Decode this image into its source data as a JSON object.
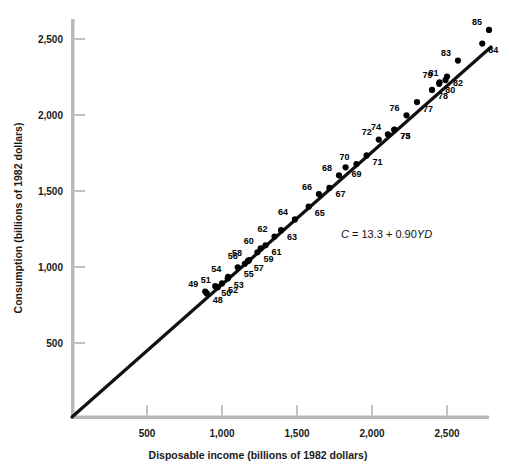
{
  "chart_data": {
    "type": "scatter",
    "title": "",
    "xlabel": "Disposable income (billions of 1982 dollars)",
    "ylabel": "Consumption (billions of 1982 dollars)",
    "xlim": [
      0,
      2900
    ],
    "ylim": [
      0,
      2650
    ],
    "xticks": [
      500,
      1000,
      1500,
      2000,
      2500
    ],
    "xticklabels": [
      "500",
      "1,000",
      "1,500",
      "2,000",
      "2,500"
    ],
    "yticks": [
      500,
      1000,
      1500,
      2000,
      2500
    ],
    "yticklabels": [
      "500",
      "1,000",
      "1,500",
      "2,000",
      "2,500"
    ],
    "grid": false,
    "legend": null,
    "annotation": {
      "text": "C = 13.3 + 0.90YD",
      "parts": [
        "C",
        " = 13.3 + 0.90",
        "YD"
      ],
      "x": 1680,
      "y": 1180
    },
    "fit_line": {
      "label": "C = 13.3 + 0.90YD",
      "intercept": 13.3,
      "slope": 0.9,
      "x_start": 0,
      "x_end": 2790
    },
    "point_label_key": "year (two-digit, 1948-1985)",
    "points": [
      {
        "label": "48",
        "x": 899,
        "y": 826
      },
      {
        "label": "49",
        "x": 888,
        "y": 838
      },
      {
        "label": "50",
        "x": 955,
        "y": 874
      },
      {
        "label": "51",
        "x": 972,
        "y": 867
      },
      {
        "label": "52",
        "x": 1000,
        "y": 892
      },
      {
        "label": "53",
        "x": 1038,
        "y": 924
      },
      {
        "label": "54",
        "x": 1041,
        "y": 935
      },
      {
        "label": "55",
        "x": 1105,
        "y": 998
      },
      {
        "label": "56",
        "x": 1152,
        "y": 1021
      },
      {
        "label": "57",
        "x": 1172,
        "y": 1038
      },
      {
        "label": "58",
        "x": 1180,
        "y": 1045
      },
      {
        "label": "59",
        "x": 1236,
        "y": 1097
      },
      {
        "label": "60",
        "x": 1258,
        "y": 1123
      },
      {
        "label": "61",
        "x": 1290,
        "y": 1143
      },
      {
        "label": "62",
        "x": 1350,
        "y": 1200
      },
      {
        "label": "63",
        "x": 1394,
        "y": 1242
      },
      {
        "label": "64",
        "x": 1486,
        "y": 1313
      },
      {
        "label": "65",
        "x": 1578,
        "y": 1397
      },
      {
        "label": "66",
        "x": 1646,
        "y": 1480
      },
      {
        "label": "67",
        "x": 1716,
        "y": 1520
      },
      {
        "label": "68",
        "x": 1780,
        "y": 1603
      },
      {
        "label": "69",
        "x": 1824,
        "y": 1656
      },
      {
        "label": "70",
        "x": 1896,
        "y": 1677
      },
      {
        "label": "71",
        "x": 1964,
        "y": 1734
      },
      {
        "label": "72",
        "x": 2045,
        "y": 1838
      },
      {
        "label": "73",
        "x": 2148,
        "y": 1903
      },
      {
        "label": "74",
        "x": 2106,
        "y": 1873
      },
      {
        "label": "75",
        "x": 2150,
        "y": 1904
      },
      {
        "label": "76",
        "x": 2230,
        "y": 1998
      },
      {
        "label": "77",
        "x": 2300,
        "y": 2085
      },
      {
        "label": "78",
        "x": 2400,
        "y": 2165
      },
      {
        "label": "79",
        "x": 2450,
        "y": 2215
      },
      {
        "label": "80",
        "x": 2448,
        "y": 2205
      },
      {
        "label": "81",
        "x": 2490,
        "y": 2230
      },
      {
        "label": "82",
        "x": 2500,
        "y": 2253
      },
      {
        "label": "83",
        "x": 2573,
        "y": 2358
      },
      {
        "label": "84",
        "x": 2735,
        "y": 2470
      },
      {
        "label": "85",
        "x": 2780,
        "y": 2560
      }
    ]
  },
  "axes": {
    "x_title": "Disposable income (billions of 1982 dollars)",
    "y_title": "Consumption (billions of 1982 dollars)",
    "x_tick_labels": [
      "500",
      "1,000",
      "1,500",
      "2,000",
      "2,500"
    ],
    "y_tick_labels": [
      "500",
      "1,000",
      "1,500",
      "2,000",
      "2,500"
    ]
  },
  "colors": {
    "axis": "#b8b8b8",
    "tick": "#9a9a9a",
    "line": "#111111",
    "marker": "#000000",
    "text": "#1a1a1a",
    "background": "#ffffff"
  }
}
